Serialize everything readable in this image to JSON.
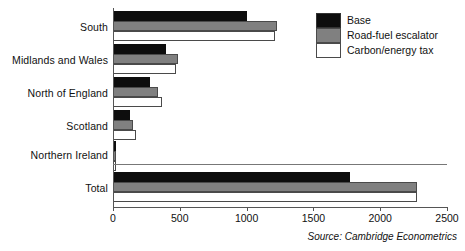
{
  "chart_data": {
    "type": "bar",
    "orientation": "horizontal",
    "title": "",
    "xlabel": "",
    "ylabel": "",
    "xlim": [
      0,
      2500
    ],
    "xticks": [
      0,
      500,
      1000,
      1500,
      2000,
      2500
    ],
    "xtick_labels": [
      "0",
      "500",
      "1000",
      "1500",
      "2000",
      "2500"
    ],
    "grid": false,
    "legend_position": "top-right",
    "categories": [
      "South",
      "Midlands and Wales",
      "North of England",
      "Scotland",
      "Northern Ireland",
      "Total"
    ],
    "series": [
      {
        "name": "Base",
        "color": "#0d0d0d",
        "values": [
          1000,
          400,
          280,
          125,
          20,
          1775
        ]
      },
      {
        "name": "Road-fuel escalator",
        "color": "#808080",
        "values": [
          1230,
          485,
          340,
          150,
          25,
          2275
        ]
      },
      {
        "name": "Carbon/energy tax",
        "color": "#ffffff",
        "values": [
          1215,
          470,
          370,
          170,
          25,
          2275
        ]
      }
    ],
    "separator_after_category": "Northern Ireland",
    "source": "Source: Cambridge Econometrics"
  },
  "legend": {
    "items": [
      {
        "label": "Base",
        "swatch": "base"
      },
      {
        "label": "Road-fuel escalator",
        "swatch": "escalator"
      },
      {
        "label": "Carbon/energy tax",
        "swatch": "carbon"
      }
    ]
  },
  "footer": {
    "source_text": "Source: Cambridge Econometrics"
  }
}
